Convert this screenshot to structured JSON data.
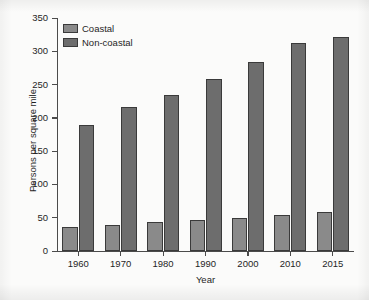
{
  "chart_data": {
    "type": "bar",
    "title": "",
    "subtitle": "",
    "xlabel": "Year",
    "ylabel": "Persons per square mile",
    "categories": [
      "1960",
      "1970",
      "1980",
      "1990",
      "2000",
      "2010",
      "2015"
    ],
    "series": [
      {
        "name": "Coastal",
        "values": [
          36,
          39,
          43,
          46,
          49,
          54,
          59
        ],
        "color": "#8a8a8a"
      },
      {
        "name": "Non-coastal",
        "values": [
          190,
          217,
          234,
          258,
          284,
          313,
          322
        ],
        "color": "#6d6d6d"
      }
    ],
    "ylim": [
      0,
      350
    ],
    "yticks": [
      0,
      50,
      100,
      150,
      200,
      250,
      300,
      350
    ],
    "ytick_labels": [
      "0",
      "50",
      "100",
      "150",
      "200",
      "250",
      "300",
      "350"
    ],
    "grid": false,
    "legend_position": "upper-left",
    "legend_entries": [
      "Coastal",
      "Non-coastal"
    ],
    "annotations": []
  },
  "legend": {
    "items": [
      {
        "label": "Coastal"
      },
      {
        "label": "Non-coastal"
      }
    ]
  },
  "axes": {
    "y_title": "Persons per square mile",
    "x_title": "Year"
  },
  "colors": {
    "coastal": "#8a8a8a",
    "noncoastal": "#6d6d6d",
    "axis": "#4b4b4b",
    "plot_background": "#fbfbfa",
    "page_background": "#f2f2f2"
  }
}
